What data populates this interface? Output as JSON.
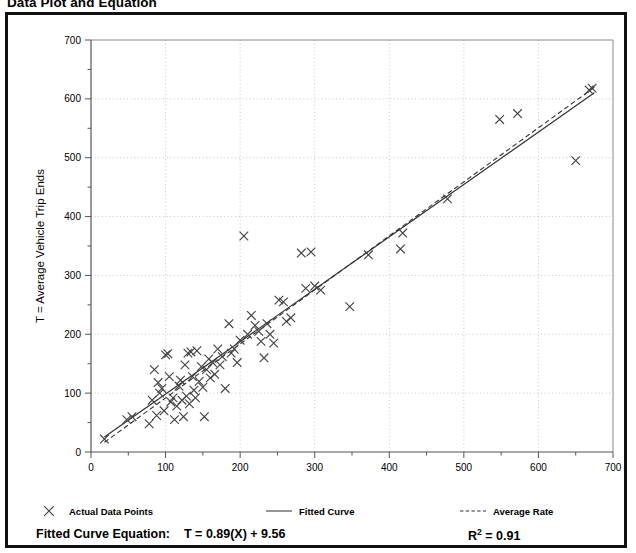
{
  "page": {
    "title": "Data Plot and Equation"
  },
  "legend": {
    "items": [
      {
        "label": "Actual Data Points",
        "marker": "cross-marker"
      },
      {
        "label": "Fitted Curve",
        "marker": "solid-line-marker"
      },
      {
        "label": "Average Rate",
        "marker": "dashed-line-marker"
      }
    ]
  },
  "equation": {
    "label": "Fitted Curve Equation:",
    "formula": "T = 0.89(X) + 9.56",
    "r_squared_prefix": "R",
    "r_squared_exponent": "2",
    "r_squared_value": "= 0.91"
  },
  "colors": {
    "frame": "#111111",
    "axis": "#555555",
    "grid": "#bfbfbf",
    "marker": "#444444",
    "fitted_line": "#333333",
    "average_line": "#333333"
  },
  "chart_data": {
    "type": "scatter",
    "title": "Data Plot and Equation",
    "xlabel": "X = Number of Dwelling Units",
    "ylabel": "T = Average Vehicle Trip Ends",
    "xlim": [
      0,
      700
    ],
    "ylim": [
      0,
      700
    ],
    "xticks": [
      0,
      100,
      200,
      300,
      400,
      500,
      600,
      700
    ],
    "yticks": [
      0,
      100,
      200,
      300,
      400,
      500,
      600,
      700
    ],
    "minor_tick_step": 50,
    "grid": true,
    "legend_position": "below-plot",
    "series": [
      {
        "name": "Actual Data Points",
        "type": "scatter",
        "marker": "x",
        "points": [
          [
            18,
            22
          ],
          [
            48,
            55
          ],
          [
            55,
            60
          ],
          [
            78,
            48
          ],
          [
            82,
            88
          ],
          [
            85,
            140
          ],
          [
            88,
            62
          ],
          [
            90,
            118
          ],
          [
            92,
            100
          ],
          [
            95,
            108
          ],
          [
            98,
            70
          ],
          [
            100,
            165
          ],
          [
            103,
            167
          ],
          [
            105,
            128
          ],
          [
            107,
            85
          ],
          [
            110,
            92
          ],
          [
            112,
            55
          ],
          [
            115,
            78
          ],
          [
            118,
            112
          ],
          [
            120,
            122
          ],
          [
            122,
            88
          ],
          [
            124,
            60
          ],
          [
            126,
            148
          ],
          [
            128,
            95
          ],
          [
            130,
            168
          ],
          [
            132,
            82
          ],
          [
            134,
            170
          ],
          [
            136,
            128
          ],
          [
            138,
            105
          ],
          [
            140,
            92
          ],
          [
            142,
            172
          ],
          [
            145,
            120
          ],
          [
            148,
            145
          ],
          [
            150,
            110
          ],
          [
            152,
            60
          ],
          [
            155,
            140
          ],
          [
            158,
            158
          ],
          [
            160,
            126
          ],
          [
            163,
            152
          ],
          [
            166,
            132
          ],
          [
            170,
            175
          ],
          [
            173,
            148
          ],
          [
            176,
            162
          ],
          [
            180,
            108
          ],
          [
            185,
            218
          ],
          [
            188,
            168
          ],
          [
            192,
            175
          ],
          [
            196,
            152
          ],
          [
            200,
            190
          ],
          [
            205,
            367
          ],
          [
            210,
            200
          ],
          [
            215,
            232
          ],
          [
            220,
            215
          ],
          [
            225,
            205
          ],
          [
            228,
            188
          ],
          [
            232,
            160
          ],
          [
            236,
            218
          ],
          [
            240,
            200
          ],
          [
            245,
            185
          ],
          [
            252,
            258
          ],
          [
            258,
            255
          ],
          [
            262,
            222
          ],
          [
            268,
            228
          ],
          [
            282,
            338
          ],
          [
            288,
            278
          ],
          [
            295,
            340
          ],
          [
            300,
            282
          ],
          [
            308,
            275
          ],
          [
            347,
            247
          ],
          [
            372,
            335
          ],
          [
            415,
            345
          ],
          [
            418,
            372
          ],
          [
            478,
            430
          ],
          [
            548,
            565
          ],
          [
            572,
            575
          ],
          [
            650,
            495
          ],
          [
            668,
            615
          ],
          [
            672,
            618
          ]
        ]
      },
      {
        "name": "Fitted Curve",
        "type": "line",
        "style": "solid",
        "equation": "T = 0.89(X) + 9.56",
        "slope": 0.89,
        "intercept": 9.56,
        "r_squared": 0.91,
        "x_range": [
          18,
          675
        ]
      },
      {
        "name": "Average Rate",
        "type": "line",
        "style": "dashed",
        "slope": 0.918,
        "intercept": 0.0,
        "x_range": [
          18,
          675
        ]
      }
    ]
  }
}
